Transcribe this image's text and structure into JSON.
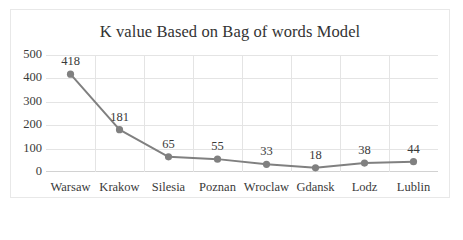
{
  "chart_data": {
    "type": "line",
    "title": "K value Based on Bag of words Model",
    "xlabel": "",
    "ylabel": "",
    "categories": [
      "Warsaw",
      "Krakow",
      "Silesia",
      "Poznan",
      "Wroclaw",
      "Gdansk",
      "Lodz",
      "Lublin"
    ],
    "values": [
      418,
      181,
      65,
      55,
      33,
      18,
      38,
      44
    ],
    "data_labels": [
      "418",
      "181",
      "65",
      "55",
      "33",
      "18",
      "38",
      "44"
    ],
    "ylim": [
      0,
      500
    ],
    "yticks": [
      500,
      400,
      300,
      200,
      100,
      0
    ],
    "ytick_labels": [
      "500",
      "400",
      "300",
      "200",
      "100",
      "0"
    ],
    "grid": true,
    "legend": "none",
    "series": [
      {
        "name": "K value",
        "values": [
          418,
          181,
          65,
          55,
          33,
          18,
          38,
          44
        ],
        "line_color": "#808080",
        "marker_color": "#808080",
        "marker": "circle"
      }
    ],
    "colors": {
      "line": "#808080",
      "marker": "#808080",
      "grid": "#e4e4e4",
      "axis": "#d2d2d2",
      "text": "#3a3a3a",
      "title": "#333333",
      "background": "#ffffff",
      "frame": "#e8e8e8"
    }
  }
}
